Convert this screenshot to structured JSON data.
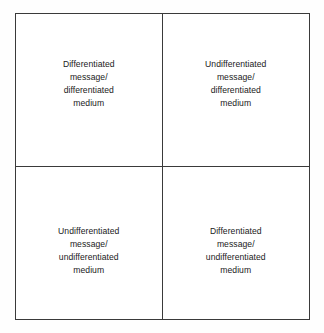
{
  "figure": {
    "name": "message-medium-differentiation-matrix",
    "type": "2x2-matrix",
    "border_color": "#3a3a3a",
    "text_color": "#1a1a1a",
    "background_color": "#ffffff"
  },
  "quadrants": [
    {
      "position": "top-left",
      "label": "Differentiated\nmessage/\ndifferentiated\nmedium",
      "lines": [
        "Differentiated",
        "message/",
        "differentiated",
        "medium"
      ]
    },
    {
      "position": "top-right",
      "label": "Undifferentiated\nmessage/\ndifferentiated\nmedium",
      "lines": [
        "Undifferentiated",
        "message/",
        "differentiated",
        "medium"
      ]
    },
    {
      "position": "bottom-left",
      "label": "Undifferentiated\nmessage/\nundifferentiated\nmedium",
      "lines": [
        "Undifferentiated",
        "message/",
        "undifferentiated",
        "medium"
      ]
    },
    {
      "position": "bottom-right",
      "label": "Differentiated\nmessage/\nundifferentiated\nmedium",
      "lines": [
        "Differentiated",
        "message/",
        "undifferentiated",
        "medium"
      ]
    }
  ]
}
